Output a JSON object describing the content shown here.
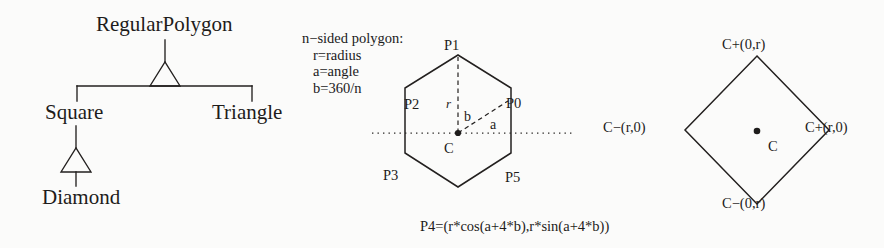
{
  "figure": {
    "background_color": "#fbfbfa",
    "ink_color": "#1e1c1b"
  },
  "uml_hierarchy": {
    "root_label": "RegularPolygon",
    "children": [
      {
        "label": "Square"
      },
      {
        "label": "Triangle"
      }
    ],
    "grandchild": {
      "label": "Diamond",
      "parent": "Square"
    }
  },
  "hexagon_panel": {
    "note_lines": [
      "n−sided polygon:",
      "r=radius",
      "a=angle",
      "b=360/n"
    ],
    "vertex_labels": {
      "p0": "P0",
      "p1": "P1",
      "p2": "P2",
      "p3": "P3",
      "p5": "P5"
    },
    "center_label": "C",
    "radius_label": "r",
    "angle_b_label": "b",
    "angle_a_label": "a",
    "formula": "P4=(r*cos(a+4*b),r*sin(a+4*b))"
  },
  "diamond_panel": {
    "top_label": "C+(0,r)",
    "left_label": "C−(r,0)",
    "right_label": "C+(r,0)",
    "bottom_label": "C−(0,r)",
    "center_label": "C"
  }
}
